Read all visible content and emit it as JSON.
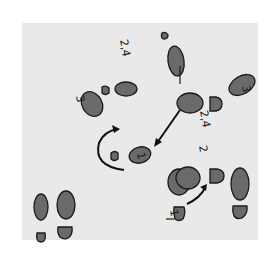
{
  "diagram": {
    "type": "dance-step-footprint-diagram",
    "background_color": "#e9e9e9",
    "footprint_fill": "#6a6a6a",
    "labels": [
      {
        "id": "label-top-left",
        "text": "2,4"
      },
      {
        "id": "label-left",
        "text": "3"
      },
      {
        "id": "label-center-right",
        "text": "2,4"
      },
      {
        "id": "label-top-right",
        "text": "3"
      },
      {
        "id": "label-right",
        "text": "2"
      },
      {
        "id": "label-center",
        "text": "1"
      },
      {
        "id": "label-bottom-right",
        "text": "1"
      }
    ]
  }
}
